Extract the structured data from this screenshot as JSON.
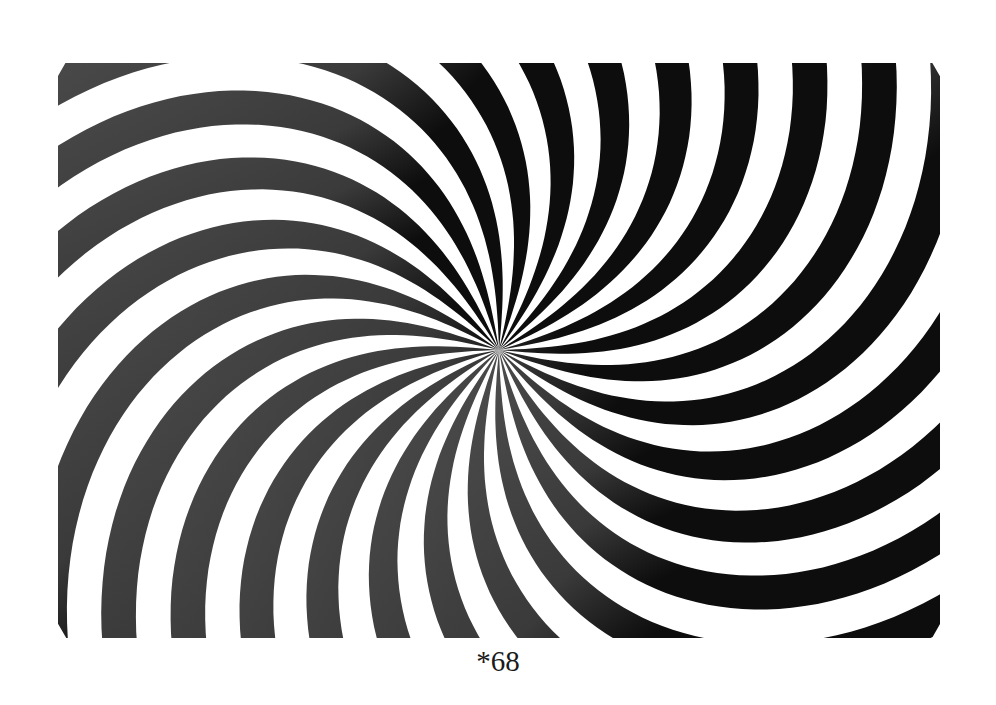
{
  "figure": {
    "caption": "*68",
    "spiral": {
      "arm_count": 24,
      "center_x": 441,
      "center_y": 287,
      "twist_degrees_at_max_radius": -62,
      "max_radius": 520,
      "twist_exponent": 1.6,
      "start_angle_degrees": -2,
      "fill_fraction": 0.5
    },
    "colors": {
      "stripe_dark": "#0d0d0d",
      "stripe_grey": "#4d4d4d",
      "background": "#ffffff",
      "caption": "#1a1a1a"
    }
  }
}
